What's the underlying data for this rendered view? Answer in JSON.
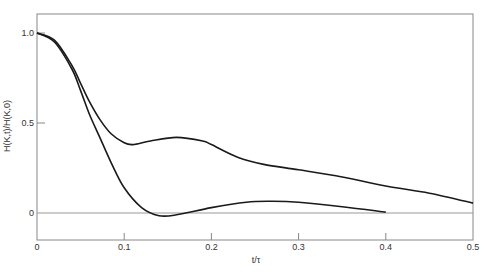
{
  "chart_data": {
    "type": "line",
    "title": "",
    "xlabel": "t/τ",
    "ylabel": "H(K,t)/H(K,0)",
    "xlim": [
      0,
      0.5
    ],
    "ylim": [
      -0.15,
      1.1
    ],
    "x_ticks": [
      "0",
      "0.1",
      "0.2",
      "0.3",
      "0.4",
      "0.5"
    ],
    "y_ticks": [
      "0",
      "0.5",
      "1.0"
    ],
    "grid": false,
    "legend": null,
    "zero_line": true,
    "series": [
      {
        "name": "upper curve",
        "x": [
          0,
          0.02,
          0.04,
          0.05,
          0.06,
          0.072,
          0.085,
          0.1,
          0.11,
          0.13,
          0.16,
          0.19,
          0.2,
          0.23,
          0.26,
          0.3,
          0.35,
          0.4,
          0.45,
          0.5
        ],
        "y": [
          1.0,
          0.96,
          0.82,
          0.72,
          0.62,
          0.52,
          0.44,
          0.39,
          0.38,
          0.4,
          0.42,
          0.4,
          0.38,
          0.31,
          0.27,
          0.24,
          0.2,
          0.15,
          0.11,
          0.055
        ]
      },
      {
        "name": "lower curve",
        "x": [
          0,
          0.02,
          0.04,
          0.05,
          0.06,
          0.072,
          0.085,
          0.1,
          0.12,
          0.14,
          0.16,
          0.2,
          0.24,
          0.27,
          0.3,
          0.35,
          0.4
        ],
        "y": [
          1.0,
          0.95,
          0.8,
          0.68,
          0.55,
          0.42,
          0.28,
          0.14,
          0.03,
          -0.015,
          -0.01,
          0.03,
          0.06,
          0.065,
          0.06,
          0.035,
          0.005
        ]
      }
    ]
  },
  "colors": {
    "curve": "#1a1a1a",
    "frame": "#888888",
    "zero_line": "#999999",
    "text": "#333333"
  }
}
